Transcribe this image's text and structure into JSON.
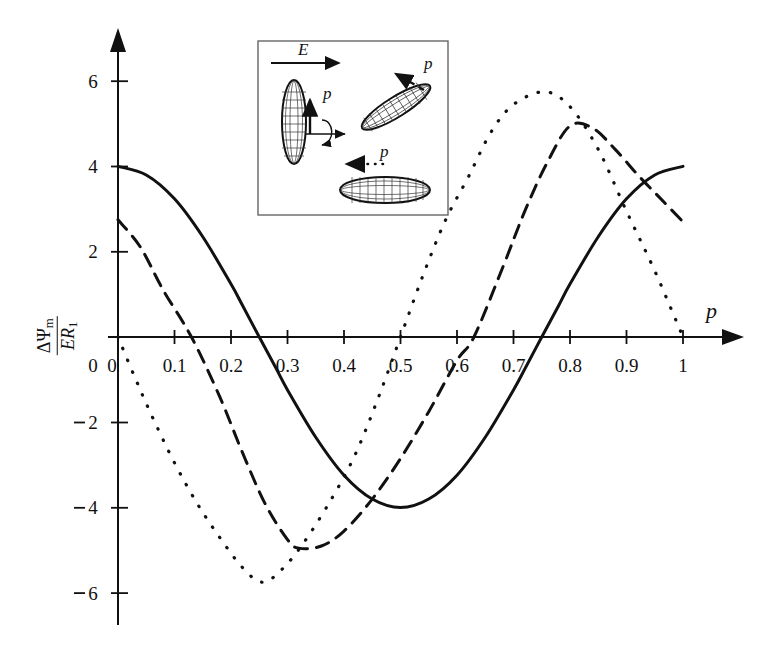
{
  "figure": {
    "name": "energy-curve-plot",
    "background": "#ffffff",
    "ink_color": "#111111"
  },
  "axes": {
    "x_label": "p",
    "y_label_numerator": "ΔΨ",
    "y_label_numerator_sub": "m",
    "y_label_denominator": "ER",
    "y_label_denominator_sub": "1",
    "x_ticks": [
      "0",
      "0.1",
      "0.2",
      "0.3",
      "0.4",
      "0.5",
      "0.6",
      "0.7",
      "0.8",
      "0.9",
      "1"
    ],
    "x_tick_values": [
      0,
      0.1,
      0.2,
      0.3,
      0.4,
      0.5,
      0.6,
      0.7,
      0.8,
      0.9,
      1.0
    ],
    "y_ticks": [
      "6",
      "4",
      "2",
      "0",
      "2",
      "4",
      "6"
    ],
    "y_tick_values": [
      6,
      4,
      2,
      0,
      -2,
      -4,
      -6
    ]
  },
  "inset": {
    "name": "ellipsoid-orientation-diagram",
    "field_label": "E",
    "dipole_label_solid": "p",
    "dipole_label_dashed": "p",
    "dipole_label_dotted": "p",
    "border_color": "#555555",
    "description_labels": [
      "E",
      "p",
      "p",
      "p"
    ]
  },
  "chart_data": {
    "type": "line",
    "title": "",
    "xlabel": "p",
    "ylabel": "ΔΨm / ER1",
    "xlim": [
      0,
      1
    ],
    "ylim": [
      -6,
      6
    ],
    "grid": false,
    "legend": "none",
    "x_tick_labels": [
      "0",
      "0.1",
      "0.2",
      "0.3",
      "0.4",
      "0.5",
      "0.6",
      "0.7",
      "0.8",
      "0.9",
      "1"
    ],
    "y_tick_labels": [
      "6",
      "4",
      "2",
      "0",
      "-2",
      "-4",
      "-6"
    ],
    "series": [
      {
        "name": "solid-curve",
        "style": "solid",
        "color": "#111111",
        "linewidth": 3.0,
        "note": "Starts at 4.0 at p=0, zero crossing at p=0.25 descending, minimum -4.0 near p=0.50, zero crossing at p=0.75 ascending, returns to 4.0 at p=1.",
        "x": [
          0.0,
          0.05,
          0.1,
          0.15,
          0.2,
          0.22,
          0.25,
          0.28,
          0.3,
          0.35,
          0.4,
          0.45,
          0.5,
          0.55,
          0.6,
          0.65,
          0.7,
          0.72,
          0.75,
          0.78,
          0.8,
          0.85,
          0.9,
          0.95,
          1.0
        ],
        "y": [
          4.0,
          3.8,
          3.24,
          2.35,
          1.24,
          0.75,
          0.0,
          -0.74,
          -1.24,
          -2.35,
          -3.24,
          -3.8,
          -4.0,
          -3.8,
          -3.24,
          -2.35,
          -1.24,
          -0.75,
          0.0,
          0.74,
          1.24,
          2.35,
          3.24,
          3.8,
          4.0
        ]
      },
      {
        "name": "dashed-curve",
        "style": "dashed",
        "color": "#111111",
        "linewidth": 3.0,
        "note": "Starts at 2.75 at p=0, zero crossing near p=0.13 descending, minimum about -5.0 near p=0.32, zero crossing near p=0.63 ascending, maximum about 5.0 near p=0.80, ends about 2.7 at p=1.",
        "x": [
          0.0,
          0.04,
          0.08,
          0.13,
          0.18,
          0.22,
          0.26,
          0.3,
          0.32,
          0.36,
          0.4,
          0.45,
          0.5,
          0.55,
          0.6,
          0.63,
          0.68,
          0.72,
          0.76,
          0.8,
          0.84,
          0.88,
          0.92,
          0.96,
          1.0
        ],
        "y": [
          2.75,
          2.1,
          1.1,
          0.0,
          -1.4,
          -2.7,
          -3.9,
          -4.75,
          -4.95,
          -4.9,
          -4.55,
          -3.8,
          -2.85,
          -1.75,
          -0.55,
          0.0,
          1.6,
          2.95,
          4.1,
          4.95,
          4.9,
          4.4,
          3.8,
          3.25,
          2.7
        ]
      },
      {
        "name": "dotted-curve",
        "style": "dotted",
        "color": "#111111",
        "linewidth": 3.2,
        "note": "Starts at 0 at p=0 descending, minimum about -5.75 near p=0.255, zero crossing at p=0.50 ascending, maximum about 5.7 near p=0.755, returns to 0 at p=1.",
        "x": [
          0.0,
          0.03,
          0.06,
          0.1,
          0.14,
          0.18,
          0.22,
          0.255,
          0.29,
          0.33,
          0.38,
          0.42,
          0.46,
          0.5,
          0.54,
          0.58,
          0.62,
          0.66,
          0.7,
          0.755,
          0.8,
          0.85,
          0.9,
          0.95,
          1.0
        ],
        "y": [
          0.0,
          -0.95,
          -1.85,
          -2.95,
          -3.9,
          -4.7,
          -5.4,
          -5.75,
          -5.45,
          -4.8,
          -3.75,
          -2.75,
          -1.45,
          0.0,
          1.45,
          2.75,
          3.75,
          4.8,
          5.45,
          5.75,
          5.4,
          4.4,
          2.95,
          1.55,
          0.0
        ]
      }
    ]
  }
}
